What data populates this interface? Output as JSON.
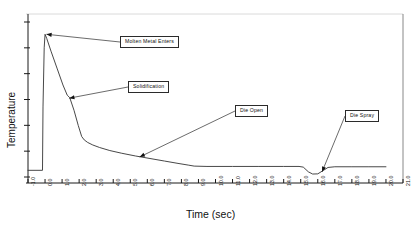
{
  "chart_data": {
    "type": "line",
    "title": "",
    "xlabel": "Time (sec)",
    "ylabel": "Temperature",
    "xlim": [
      -1.0,
      21.0
    ],
    "ylim": [
      0,
      100
    ],
    "grid": false,
    "legend": "none",
    "xticks": [
      "-1.0",
      "0.0",
      "1.0",
      "2.0",
      "3.0",
      "4.0",
      "5.0",
      "6.0",
      "7.0",
      "8.0",
      "9.0",
      "10.0",
      "11.0",
      "12.0",
      "13.0",
      "14.0",
      "15.0",
      "16.0",
      "17.0",
      "18.0",
      "19.0",
      "20.0",
      "21.0"
    ],
    "xtick_values": [
      -1,
      0,
      1,
      2,
      3,
      4,
      5,
      6,
      7,
      8,
      9,
      10,
      11,
      12,
      13,
      14,
      15,
      16,
      17,
      18,
      19,
      20,
      21
    ],
    "ytick_count": 7,
    "ytick_labels": [],
    "series": [
      {
        "name": "Die surface temperature",
        "color": "#333333",
        "x": [
          -1.0,
          -0.15,
          -0.12,
          -0.05,
          0.0,
          0.1,
          0.35,
          0.7,
          1.05,
          1.3,
          1.45,
          1.7,
          1.95,
          2.15,
          2.3,
          2.5,
          2.8,
          3.2,
          3.8,
          4.5,
          5.3,
          6.1,
          7.0,
          7.8,
          8.4,
          8.75,
          9.5,
          11.0,
          12.5,
          14.0,
          14.9,
          15.15,
          15.45,
          15.7,
          16.0,
          16.35,
          16.6,
          17.0,
          18.0,
          19.0,
          20.0
        ],
        "y": [
          7.5,
          7.5,
          45.0,
          80.0,
          88.0,
          85.5,
          78.0,
          68.0,
          58.0,
          52.0,
          50.5,
          43.0,
          34.0,
          27.5,
          25.5,
          24.0,
          22.5,
          21.0,
          19.2,
          17.6,
          16.0,
          14.6,
          13.0,
          11.6,
          10.6,
          10.0,
          9.8,
          9.8,
          9.8,
          9.8,
          9.8,
          9.4,
          6.6,
          5.3,
          5.4,
          7.6,
          9.2,
          9.6,
          9.6,
          9.6,
          9.6
        ]
      }
    ],
    "annotations": [
      {
        "label": "Molten Metal Enters",
        "target_x": 0.08,
        "target_y": 88.0
      },
      {
        "label": "Solidification",
        "target_x": 1.42,
        "target_y": 50.2
      },
      {
        "label": "Die Open",
        "target_x": 5.55,
        "target_y": 15.4
      },
      {
        "label": "Die Spray",
        "target_x": 16.25,
        "target_y": 6.6
      }
    ]
  },
  "annotations_ui": {
    "molten_metal": "Molten Metal Enters",
    "solidification": "Solidification",
    "die_open": "Die Open",
    "die_spray": "Die Spray"
  },
  "axis": {
    "x_title": "Time (sec)",
    "y_title": "Temperature"
  },
  "style": {
    "curve_color": "#333333",
    "axis_color": "#1a1a1a",
    "frame_color": "#cfcfcf",
    "background": "#ffffff"
  }
}
